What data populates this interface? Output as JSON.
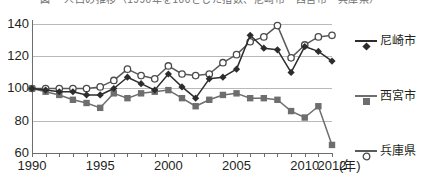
{
  "title": {
    "text": "図  　人口の推移（1990年を100とした指数、尼崎市・西宮市・兵庫県）"
  },
  "legend": {
    "position": "right",
    "items": [
      {
        "label": "尼崎市",
        "marker": "filled-diamond-marker",
        "color": "#2d2d2d"
      },
      {
        "label": "西宮市",
        "marker": "filled-square-marker",
        "color": "#6e6e6e"
      },
      {
        "label": "兵庫県",
        "marker": "open-circle-marker",
        "color": "#5a5a5a"
      }
    ]
  },
  "axes": {
    "x_unit_label": "(年)",
    "x_tick_labels": [
      "1990",
      "1995",
      "2000",
      "2005",
      "2010",
      "2012"
    ],
    "y_tick_labels": [
      "60",
      "80",
      "100",
      "120",
      "140"
    ]
  },
  "chart_data": {
    "type": "line",
    "title": "図  　人口の推移（1990年を100とした指数、尼崎市・西宮市・兵庫県）",
    "xlabel": "(年)",
    "ylabel": "",
    "xlim": [
      1990,
      2012
    ],
    "ylim": [
      60,
      140
    ],
    "y_ticks": [
      60,
      80,
      100,
      120,
      140
    ],
    "x_ticks": [
      1990,
      1995,
      2000,
      2005,
      2010,
      2012
    ],
    "grid": true,
    "legend_position": "right",
    "x": [
      1990,
      1991,
      1992,
      1993,
      1994,
      1995,
      1996,
      1997,
      1998,
      1999,
      2000,
      2001,
      2002,
      2003,
      2004,
      2005,
      2006,
      2007,
      2008,
      2009,
      2010,
      2011,
      2012
    ],
    "series": [
      {
        "name": "尼崎市",
        "marker": "filled-diamond",
        "color": "#2d2d2d",
        "values": [
          100,
          99,
          98,
          98,
          96,
          96,
          100,
          107,
          103,
          99,
          109,
          101,
          94,
          106,
          107,
          112,
          133,
          125,
          124,
          110,
          126,
          123,
          117
        ]
      },
      {
        "name": "西宮市",
        "marker": "filled-square",
        "color": "#6e6e6e",
        "values": [
          100,
          98,
          96,
          93,
          91,
          88,
          97,
          94,
          97,
          98,
          99,
          94,
          89,
          93,
          96,
          97,
          94,
          94,
          93,
          86,
          82,
          89,
          65
        ]
      },
      {
        "name": "兵庫県",
        "marker": "open-circle",
        "color": "#5a5a5a",
        "values": [
          100,
          100,
          100,
          100,
          100,
          101,
          105,
          112,
          108,
          106,
          114,
          109,
          108,
          109,
          116,
          121,
          129,
          132,
          139,
          119,
          127,
          132,
          133
        ]
      }
    ]
  }
}
